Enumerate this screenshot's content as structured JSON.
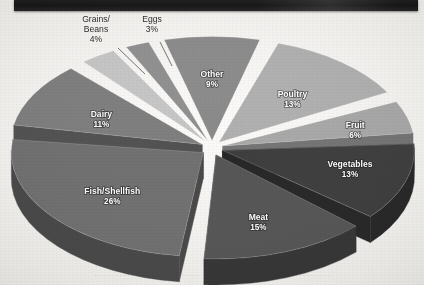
{
  "page": {
    "header_bar_label": "",
    "bleed_through_text": "............ ................ ..... ........... ..... ..........."
  },
  "chart_data": {
    "type": "pie",
    "title": "",
    "subtitle": "",
    "xlabel": "",
    "ylabel": "",
    "legend_position": "none",
    "grid": false,
    "units": "percent",
    "total": 100,
    "style": "exploded 3D pie, grayscale scan",
    "categories": [
      "Other",
      "Poultry",
      "Fruit",
      "Vegetables",
      "Meat",
      "Fish/Shellfish",
      "Dairy",
      "Grains/Beans",
      "Eggs"
    ],
    "values": [
      9,
      13,
      6,
      13,
      15,
      26,
      11,
      4,
      3
    ],
    "slices": [
      {
        "label": "Other",
        "value": 9,
        "pct_text": "9%",
        "color": "#8b8b8b",
        "side_color": "#5c5c5c",
        "label_placement": "inside"
      },
      {
        "label": "Poultry",
        "value": 13,
        "pct_text": "13%",
        "color": "#b0b0b0",
        "side_color": "#7a7a7a",
        "label_placement": "inside"
      },
      {
        "label": "Fruit",
        "value": 6,
        "pct_text": "6%",
        "color": "#a8a8a8",
        "side_color": "#747474",
        "label_placement": "inside"
      },
      {
        "label": "Vegetables",
        "value": 13,
        "pct_text": "13%",
        "color": "#3e3e3e",
        "side_color": "#262626",
        "label_placement": "inside"
      },
      {
        "label": "Meat",
        "value": 15,
        "pct_text": "15%",
        "color": "#555555",
        "side_color": "#353535",
        "label_placement": "inside"
      },
      {
        "label": "Fish/Shellfish",
        "value": 26,
        "pct_text": "26%",
        "color": "#6f6f6f",
        "side_color": "#484848",
        "label_placement": "inside"
      },
      {
        "label": "Dairy",
        "value": 11,
        "pct_text": "11%",
        "color": "#7e7e7e",
        "side_color": "#515151",
        "label_placement": "inside"
      },
      {
        "label": "Grains/Beans",
        "value": 4,
        "pct_text": "4%",
        "color": "#c6c6c6",
        "side_color": "#8e8e8e",
        "label_placement": "outside"
      },
      {
        "label": "Eggs",
        "value": 3,
        "pct_text": "3%",
        "color": "#909090",
        "side_color": "#5f5f5f",
        "label_placement": "outside"
      }
    ],
    "external_labels": [
      {
        "name": "Grains/Beans",
        "lines": [
          "Grains/",
          "Beans",
          "4%"
        ]
      },
      {
        "name": "Eggs",
        "lines": [
          "Eggs",
          "3%"
        ]
      }
    ]
  },
  "colors": {
    "background": "#f2f1ee",
    "header_bar": "#1d1d1d",
    "label_inside": "#ffffff",
    "label_outside": "#2b2b2b",
    "leader_line": "#3a3a3a"
  }
}
